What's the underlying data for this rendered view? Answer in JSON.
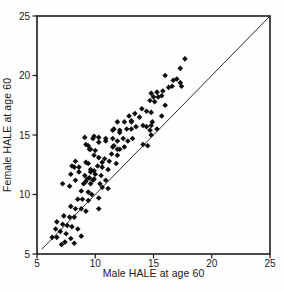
{
  "chart_data": {
    "type": "scatter",
    "title": "",
    "xlabel": "Male HALE at age 60",
    "ylabel": "Female HALE at age 60",
    "xlim": [
      5,
      25
    ],
    "ylim": [
      5,
      25
    ],
    "x_ticks": [
      5,
      10,
      15,
      20,
      25
    ],
    "y_ticks": [
      5,
      10,
      15,
      20,
      25
    ],
    "grid": false,
    "legend": "none",
    "marker": {
      "shape": "filled-diamond",
      "color": "#0d0d0d",
      "size": 5.6
    },
    "identity_line": {
      "description": "y = x reference line",
      "from": [
        5.4,
        5.4
      ],
      "to": [
        25,
        25
      ],
      "color": "#2b2b2b"
    },
    "points": [
      [
        6.3,
        6.4
      ],
      [
        6.6,
        7.1
      ],
      [
        6.7,
        6.4
      ],
      [
        6.7,
        7.7
      ],
      [
        7.0,
        6.9
      ],
      [
        7.1,
        5.8
      ],
      [
        7.2,
        7.5
      ],
      [
        7.4,
        6.0
      ],
      [
        7.5,
        6.7
      ],
      [
        7.6,
        7.4
      ],
      [
        7.9,
        6.3
      ],
      [
        8.0,
        7.3
      ],
      [
        8.2,
        5.9
      ],
      [
        8.5,
        7.1
      ],
      [
        8.8,
        6.5
      ],
      [
        7.3,
        8.2
      ],
      [
        7.8,
        8.1
      ],
      [
        8.2,
        8.1
      ],
      [
        7.9,
        9.0
      ],
      [
        8.3,
        8.8
      ],
      [
        8.8,
        8.8
      ],
      [
        9.2,
        8.6
      ],
      [
        8.5,
        9.6
      ],
      [
        8.9,
        9.6
      ],
      [
        9.4,
        9.5
      ],
      [
        10.3,
        9.7
      ],
      [
        10.3,
        8.8
      ],
      [
        10.6,
        10.6
      ],
      [
        7.8,
        10.7
      ],
      [
        8.8,
        10.3
      ],
      [
        9.4,
        10.2
      ],
      [
        9.7,
        10.0
      ],
      [
        9.2,
        11.1
      ],
      [
        9.6,
        10.9
      ],
      [
        10.4,
        10.9
      ],
      [
        11.1,
        10.5
      ],
      [
        7.2,
        10.9
      ],
      [
        7.9,
        11.7
      ],
      [
        8.2,
        12.3
      ],
      [
        8.6,
        11.9
      ],
      [
        8.6,
        12.3
      ],
      [
        9.4,
        12.6
      ],
      [
        9.6,
        12.1
      ],
      [
        9.9,
        12.0
      ],
      [
        9.1,
        11.6
      ],
      [
        9.5,
        11.4
      ],
      [
        9.9,
        11.3
      ],
      [
        8.3,
        11.2
      ],
      [
        9.0,
        10.9
      ],
      [
        9.3,
        11.3
      ],
      [
        9.8,
        11.2
      ],
      [
        9.6,
        11.9
      ],
      [
        10.0,
        11.7
      ],
      [
        10.5,
        11.6
      ],
      [
        10.9,
        11.2
      ],
      [
        8.0,
        12.4
      ],
      [
        8.3,
        12.8
      ],
      [
        9.2,
        12.7
      ],
      [
        10.2,
        12.4
      ],
      [
        10.6,
        12.3
      ],
      [
        11.1,
        12.1
      ],
      [
        10.6,
        12.7
      ],
      [
        11.8,
        12.6
      ],
      [
        9.9,
        13.3
      ],
      [
        10.3,
        13.1
      ],
      [
        10.8,
        13.0
      ],
      [
        11.2,
        12.8
      ],
      [
        9.5,
        13.8
      ],
      [
        10.0,
        13.7
      ],
      [
        11.4,
        13.4
      ],
      [
        11.9,
        13.3
      ],
      [
        9.2,
        14.2
      ],
      [
        9.4,
        14.1
      ],
      [
        9.6,
        13.8
      ],
      [
        9.1,
        14.8
      ],
      [
        9.8,
        14.7
      ],
      [
        9.9,
        14.9
      ],
      [
        10.3,
        14.8
      ],
      [
        10.9,
        14.7
      ],
      [
        11.5,
        14.7
      ],
      [
        11.9,
        14.5
      ],
      [
        12.4,
        14.7
      ],
      [
        12.8,
        14.5
      ],
      [
        13.2,
        14.7
      ],
      [
        11.5,
        14.0
      ],
      [
        11.9,
        13.8
      ],
      [
        12.5,
        14.0
      ],
      [
        14.1,
        14.2
      ],
      [
        14.5,
        14.1
      ],
      [
        10.3,
        14.4
      ],
      [
        10.9,
        14.5
      ],
      [
        11.6,
        14.1
      ],
      [
        12.1,
        13.8
      ],
      [
        11.9,
        16.1
      ],
      [
        11.5,
        15.4
      ],
      [
        12.1,
        15.2
      ],
      [
        12.5,
        16.1
      ],
      [
        13.1,
        16.2
      ],
      [
        11.6,
        15.5
      ],
      [
        12.1,
        15.4
      ],
      [
        12.7,
        15.5
      ],
      [
        13.1,
        15.5
      ],
      [
        13.5,
        15.7
      ],
      [
        14.1,
        15.8
      ],
      [
        14.7,
        15.4
      ],
      [
        15.3,
        15.5
      ],
      [
        14.9,
        16.1
      ],
      [
        14.8,
        15.0
      ],
      [
        12.9,
        16.6
      ],
      [
        13.4,
        16.8
      ],
      [
        13.8,
        16.5
      ],
      [
        15.7,
        16.6
      ],
      [
        14.0,
        17.2
      ],
      [
        14.4,
        17.0
      ],
      [
        14.8,
        16.9
      ],
      [
        14.7,
        17.9
      ],
      [
        15.1,
        17.8
      ],
      [
        16.0,
        17.5
      ],
      [
        14.8,
        18.5
      ],
      [
        15.0,
        18.2
      ],
      [
        15.4,
        18.2
      ],
      [
        15.7,
        18.3
      ],
      [
        15.3,
        18.6
      ],
      [
        15.8,
        18.7
      ],
      [
        16.3,
        19.0
      ],
      [
        16.6,
        19.1
      ],
      [
        17.4,
        19.1
      ],
      [
        17.3,
        19.4
      ],
      [
        17.0,
        19.7
      ],
      [
        16.7,
        19.6
      ],
      [
        16.0,
        20.0
      ],
      [
        17.3,
        20.6
      ],
      [
        17.7,
        21.4
      ],
      [
        13.1,
        16.1
      ],
      [
        14.4,
        15.7
      ],
      [
        14.8,
        15.8
      ]
    ]
  }
}
